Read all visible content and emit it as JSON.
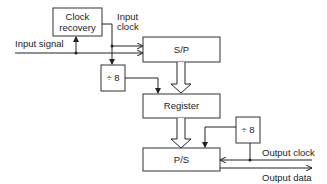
{
  "diagram": {
    "type": "block-diagram",
    "blocks": {
      "clock_recovery": {
        "line1": "Clock",
        "line2": "recovery"
      },
      "sp": {
        "label": "S/P"
      },
      "div_in": {
        "label": "÷ 8"
      },
      "register": {
        "label": "Register"
      },
      "div_out": {
        "label": "÷ 8"
      },
      "ps": {
        "label": "P/S"
      }
    },
    "signals": {
      "input_signal": "Input signal",
      "input_clock_line1": "Input",
      "input_clock_line2": "clock",
      "output_clock": "Output clock",
      "output_data": "Output data"
    },
    "connections": [
      {
        "from": "Input signal",
        "to": "S/P"
      },
      {
        "from": "Input signal",
        "to": "Clock recovery"
      },
      {
        "from": "Clock recovery",
        "to": "S/P",
        "label": "Input clock"
      },
      {
        "from": "Input clock",
        "to": "÷ 8 (input)"
      },
      {
        "from": "÷ 8 (input)",
        "to": "Register"
      },
      {
        "from": "S/P",
        "to": "Register",
        "style": "parallel-bus"
      },
      {
        "from": "Register",
        "to": "P/S",
        "style": "parallel-bus"
      },
      {
        "from": "Output clock",
        "to": "P/S"
      },
      {
        "from": "Output clock",
        "to": "÷ 8 (output)"
      },
      {
        "from": "÷ 8 (output)",
        "to": "P/S"
      },
      {
        "from": "P/S",
        "to": "Output data"
      }
    ]
  }
}
